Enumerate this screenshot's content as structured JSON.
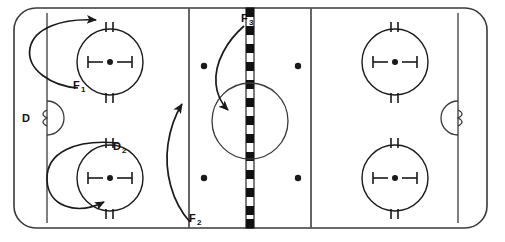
{
  "diagram": {
    "type": "hockey-rink-play-diagram",
    "colors": {
      "ice": "#ffffff",
      "lines": "#3a3a3a",
      "markings": "#1a1a1a",
      "center_line": "#111111",
      "label": "#111111"
    },
    "rink": {
      "left": 14,
      "top": 8,
      "right": 487,
      "bottom": 228,
      "corner_radius": 22
    },
    "goal_lines": [
      {
        "name": "left-goal-line",
        "x": 47
      },
      {
        "name": "right-goal-line",
        "x": 458
      }
    ],
    "blue_lines": [
      {
        "name": "left-blue-line",
        "x": 189
      },
      {
        "name": "right-blue-line",
        "x": 311
      }
    ],
    "center_line": {
      "name": "center-line",
      "x": 250,
      "width": 8,
      "pattern": "checkered",
      "block_height": 9
    },
    "center_circle": {
      "cx": 250,
      "cy": 121,
      "r": 38
    },
    "creases": [
      {
        "name": "left-crease",
        "x": 47,
        "cy": 118,
        "r": 17,
        "facing": "right"
      },
      {
        "name": "right-crease",
        "x": 458,
        "cy": 118,
        "r": 17,
        "facing": "left"
      }
    ],
    "faceoff_circles": [
      {
        "name": "faceoff-circle-upper-left",
        "cx": 110,
        "cy": 62,
        "r": 33
      },
      {
        "name": "faceoff-circle-lower-left",
        "cx": 110,
        "cy": 178,
        "r": 33
      },
      {
        "name": "faceoff-circle-upper-right",
        "cx": 395,
        "cy": 62,
        "r": 33
      },
      {
        "name": "faceoff-circle-lower-right",
        "cx": 395,
        "cy": 178,
        "r": 33
      }
    ],
    "neutral_zone_dots": [
      {
        "name": "neutral-dot-upper-left",
        "cx": 204,
        "cy": 66
      },
      {
        "name": "neutral-dot-upper-right",
        "cx": 298,
        "cy": 66
      },
      {
        "name": "neutral-dot-lower-left",
        "cx": 204,
        "cy": 178
      },
      {
        "name": "neutral-dot-lower-right",
        "cx": 298,
        "cy": 178
      }
    ],
    "labels": [
      {
        "id": "D",
        "base": "D",
        "sub": "",
        "x": 22,
        "y": 122
      },
      {
        "id": "F1",
        "base": "F",
        "sub": "1",
        "x": 73,
        "y": 89
      },
      {
        "id": "D2",
        "base": "D",
        "sub": "2",
        "x": 113,
        "y": 150
      },
      {
        "id": "F2",
        "base": "F",
        "sub": "2",
        "x": 189,
        "y": 222
      },
      {
        "id": "F3",
        "base": "F",
        "sub": "3",
        "x": 241,
        "y": 22
      }
    ],
    "movement_paths": [
      {
        "name": "path-f1",
        "label": "F1",
        "description": "Loop from F1 position curving left and up, finishing right toward the top boards"
      },
      {
        "name": "path-d2",
        "label": "D2",
        "description": "Loop around the lower-left faceoff circle finishing up-right into the circle"
      },
      {
        "name": "path-f2",
        "label": "F2",
        "description": "Curve up the left blue line from the bottom toward the neutral zone"
      },
      {
        "name": "path-f3",
        "label": "F3",
        "description": "Curve from the center line top down-left into the center circle"
      }
    ]
  }
}
